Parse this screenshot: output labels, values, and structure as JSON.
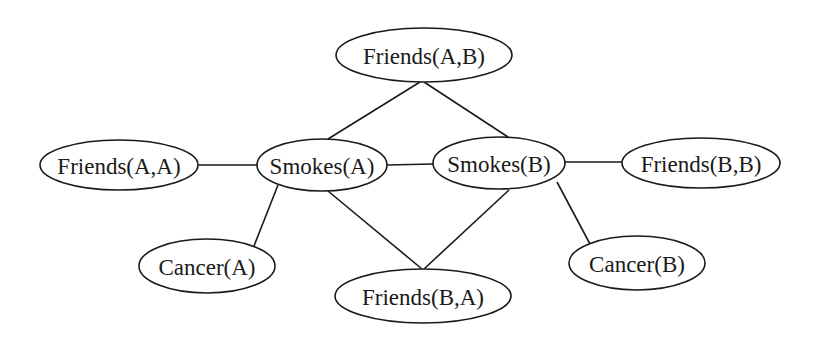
{
  "diagram": {
    "type": "markov-network",
    "nodes": [
      {
        "id": "friends_ab",
        "label": "Friends(A,B)",
        "cx": 424,
        "cy": 55,
        "rx": 88,
        "ry": 27
      },
      {
        "id": "friends_aa",
        "label": "Friends(A,A)",
        "cx": 119,
        "cy": 165,
        "rx": 79,
        "ry": 25
      },
      {
        "id": "smokes_a",
        "label": "Smokes(A)",
        "cx": 322,
        "cy": 165,
        "rx": 65,
        "ry": 26
      },
      {
        "id": "smokes_b",
        "label": "Smokes(B)",
        "cx": 499,
        "cy": 163,
        "rx": 66,
        "ry": 26
      },
      {
        "id": "friends_bb",
        "label": "Friends(B,B)",
        "cx": 701,
        "cy": 163,
        "rx": 79,
        "ry": 25
      },
      {
        "id": "cancer_a",
        "label": "Cancer(A)",
        "cx": 207,
        "cy": 266,
        "rx": 68,
        "ry": 27
      },
      {
        "id": "friends_ba",
        "label": "Friends(B,A)",
        "cx": 423,
        "cy": 296,
        "rx": 88,
        "ry": 27
      },
      {
        "id": "cancer_b",
        "label": "Cancer(B)",
        "cx": 637,
        "cy": 263,
        "rx": 68,
        "ry": 27
      }
    ],
    "edges": [
      {
        "from": "friends_ab",
        "to": "smokes_a",
        "x1": 420,
        "y1": 82,
        "x2": 328,
        "y2": 139
      },
      {
        "from": "friends_ab",
        "to": "smokes_b",
        "x1": 424,
        "y1": 82,
        "x2": 508,
        "y2": 137
      },
      {
        "from": "friends_aa",
        "to": "smokes_a",
        "x1": 198,
        "y1": 165,
        "x2": 257,
        "y2": 165
      },
      {
        "from": "smokes_a",
        "to": "smokes_b",
        "x1": 387,
        "y1": 165,
        "x2": 433,
        "y2": 164
      },
      {
        "from": "smokes_b",
        "to": "friends_bb",
        "x1": 565,
        "y1": 162,
        "x2": 622,
        "y2": 162
      },
      {
        "from": "smokes_a",
        "to": "cancer_a",
        "x1": 278,
        "y1": 185,
        "x2": 254,
        "y2": 246
      },
      {
        "from": "smokes_a",
        "to": "friends_ba",
        "x1": 328,
        "y1": 191,
        "x2": 422,
        "y2": 269
      },
      {
        "from": "smokes_b",
        "to": "friends_ba",
        "x1": 509,
        "y1": 190,
        "x2": 424,
        "y2": 269
      },
      {
        "from": "smokes_b",
        "to": "cancer_b",
        "x1": 557,
        "y1": 182,
        "x2": 590,
        "y2": 244
      }
    ],
    "colors": {
      "stroke": "#1a1a1a",
      "fill": "#ffffff",
      "background": "#ffffff"
    }
  }
}
